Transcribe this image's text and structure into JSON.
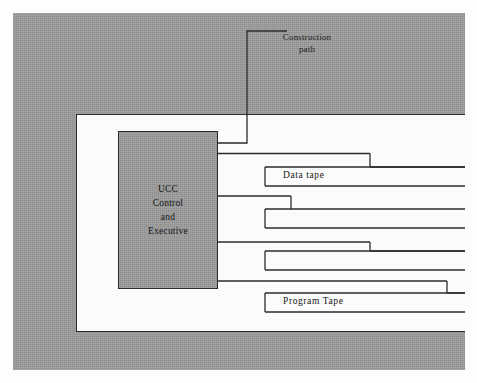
{
  "figure": {
    "type": "block-diagram",
    "background_color": "#ffffff",
    "plate_color": "#9b9b9b",
    "line_color": "#2b2b2b",
    "white_region_color": "#fbfbfb"
  },
  "blocks": {
    "processor": {
      "name": "ucc-control-and-executive",
      "lines": [
        "UCC",
        "Control",
        "and",
        "Executive"
      ],
      "fill": "#9b9b9b"
    }
  },
  "labels": {
    "construction_path": "Construction\npath",
    "construction_path_line1": "Construction",
    "construction_path_line2": "path",
    "data_tape": "Data tape",
    "program_tape": "Program Tape"
  },
  "channels": [
    {
      "id": "channel-1",
      "label": "Data tape",
      "has_label_box": true,
      "drop_x": 370
    },
    {
      "id": "channel-2",
      "label": "",
      "has_label_box": false,
      "drop_x": 291
    },
    {
      "id": "channel-3",
      "label": "",
      "has_label_box": false,
      "drop_x": 370
    },
    {
      "id": "channel-4",
      "label": "Program Tape",
      "has_label_box": true,
      "drop_x": 447
    }
  ],
  "geometry": {
    "canvas_width": 477,
    "canvas_height": 383,
    "plate": {
      "x": 13,
      "y": 13,
      "w": 452,
      "h": 357
    },
    "white_region": {
      "x": 76,
      "y": 114,
      "w": 389,
      "h": 218
    },
    "processor_block": {
      "x": 118,
      "y": 131,
      "w": 100,
      "h": 158
    },
    "right_edge_x": 465,
    "tape_box_left_x": 265
  }
}
